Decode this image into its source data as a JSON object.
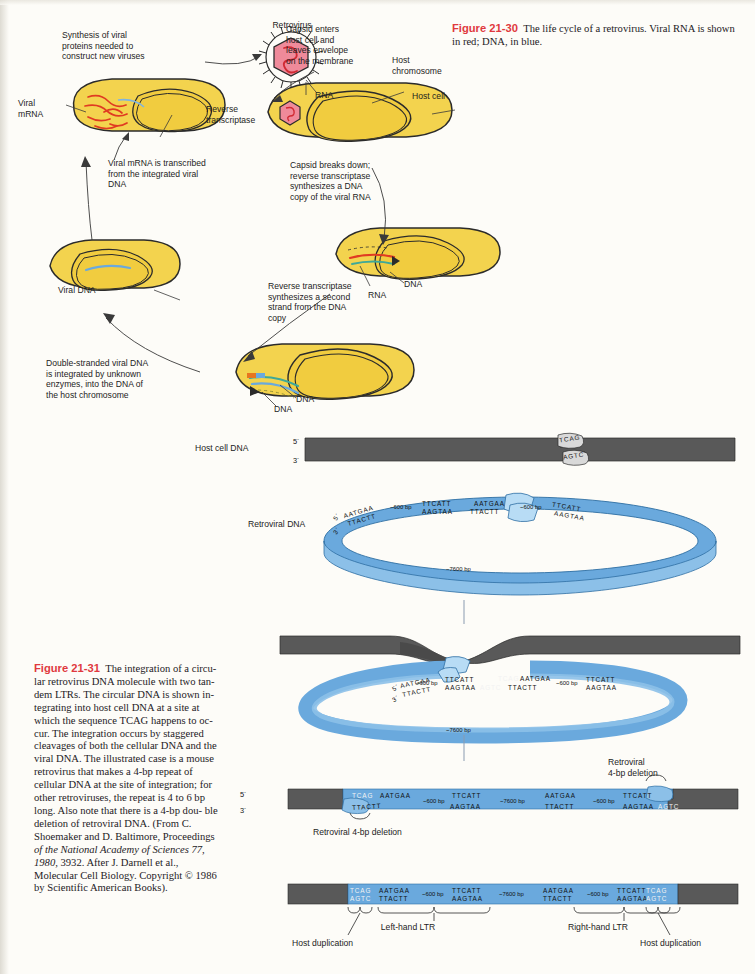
{
  "figure_2130": {
    "label": "Figure 21-30",
    "caption": "The life cycle of a retrovirus. Viral RNA is shown in red; DNA, in blue."
  },
  "figure_2131": {
    "label": "Figure 21-31",
    "caption_lines": [
      "The integration of a circu-",
      "lar retrovirus DNA molecule with two tan-",
      "dem LTRs. The circular DNA is shown in-",
      "tegrating into host cell DNA at a site at",
      "which the sequence TCAG happens to oc-",
      "cur. The integration occurs by staggered",
      "cleavages of both the cellular DNA and",
      "the viral DNA. The illustrated case is a",
      "mouse retrovirus that makes a 4-bp repeat",
      "of cellular DNA at the site of integration;",
      "for other retroviruses, the repeat is 4 to 6",
      "bp long. Also note that there is a 4-bp dou-",
      "ble deletion of retroviral DNA. (From C.",
      "Shoemaker and D. Baltimore, Proceedings",
      "of the National Academy of Sciences 77, 1980,",
      "3932. After J. Darnell et al., Molecular Cell",
      "Biology. Copyright © 1986 by Scientific",
      "American Books)."
    ]
  },
  "cycle": {
    "labels": {
      "synthesis": "Synthesis of viral\nproteins needed to\nconstruct new viruses",
      "retrovirus": "Retrovirus",
      "capsid_enters": "Capsid enters\nhost cell and\nleaves envelope\non the membrane",
      "host_chromosome": "Host\nchromosome",
      "host_cell": "Host cell",
      "rna": "RNA",
      "reverse_transcriptase": "Reverse\ntranscriptase",
      "viral_mrna": "Viral\nmRNA",
      "mrna_transcribed": "Viral mRNA is transcribed\nfrom the integrated viral\nDNA",
      "capsid_breaks": "Capsid breaks down;\nreverse transcriptase\nsynthesizes a DNA\ncopy of the viral RNA",
      "viral_dna": "Viral DNA",
      "second_strand": "Reverse transcriptase\nsynthesizes a second\nstrand from the DNA\ncopy",
      "dna_1": "DNA",
      "rna_2": "RNA",
      "double_stranded": "Double-stranded viral DNA\nis integrated by unknown\nenzymes, into the DNA of\nthe host chromosome",
      "dna_2": "DNA",
      "dna_3": "DNA"
    }
  },
  "integration": {
    "host_cell_dna_label": "Host cell DNA",
    "retroviral_dna_label": "Retroviral DNA",
    "five_prime": "5´",
    "three_prime": "3´",
    "host_top_seq": "TCAG",
    "host_bottom_seq": "AGTC",
    "circle_size": "~7600 bp",
    "ltr_spacer": "~600 bp",
    "seq_top_left": "AATGAA",
    "seq_bottom_left": "TTACTT",
    "seq_top_right": "TTCATT",
    "seq_bottom_right": "AAGTAA",
    "deletion_label": "Retroviral\n4-bp deletion",
    "deletion_label_left": "Retroviral 4-bp deletion",
    "left_ltr": "Left-hand LTR",
    "right_ltr": "Right-hand LTR",
    "host_duplication": "Host duplication"
  },
  "colors": {
    "fig_red": "#e0393e",
    "cell_yellow": "#f3d34e",
    "virus_pink": "#ef8a9a",
    "dna_blue": "#6aa9dd",
    "host_gray": "#555555",
    "rna_red": "#e03b22",
    "paper": "#fdfcf8"
  }
}
